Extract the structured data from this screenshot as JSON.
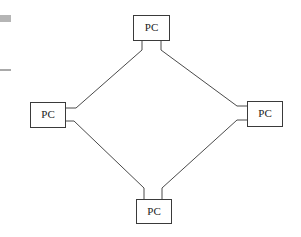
{
  "diagram": {
    "type": "ring-network",
    "colors": {
      "stroke": "#3a3a3a",
      "line": "#4a4a4a",
      "background": "#ffffff",
      "edge_bar": "#b5b5b5"
    },
    "nodes": [
      {
        "id": "top",
        "label": "PC"
      },
      {
        "id": "left",
        "label": "PC"
      },
      {
        "id": "right",
        "label": "PC"
      },
      {
        "id": "bottom",
        "label": "PC"
      }
    ],
    "edges": [
      {
        "from": "top",
        "to": "left"
      },
      {
        "from": "top",
        "to": "right"
      },
      {
        "from": "left",
        "to": "bottom"
      },
      {
        "from": "right",
        "to": "bottom"
      }
    ]
  }
}
